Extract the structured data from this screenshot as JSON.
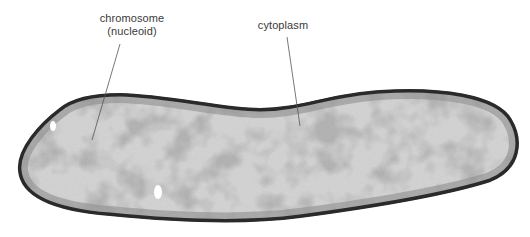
{
  "figure": {
    "labels": [
      {
        "id": "chromosome",
        "line1": "chromosome",
        "line2": "(nucleoid)"
      },
      {
        "id": "cytoplasm",
        "line1": "cytoplasm"
      }
    ],
    "colors": {
      "background": "#ffffff",
      "cell_wall": "#2f2f2f",
      "cytoplasm_dark": "#7a7a7a",
      "nucleoid_light": "#e4e4e4",
      "label_text": "#3a3a3a",
      "leader_line": "#555555"
    }
  }
}
